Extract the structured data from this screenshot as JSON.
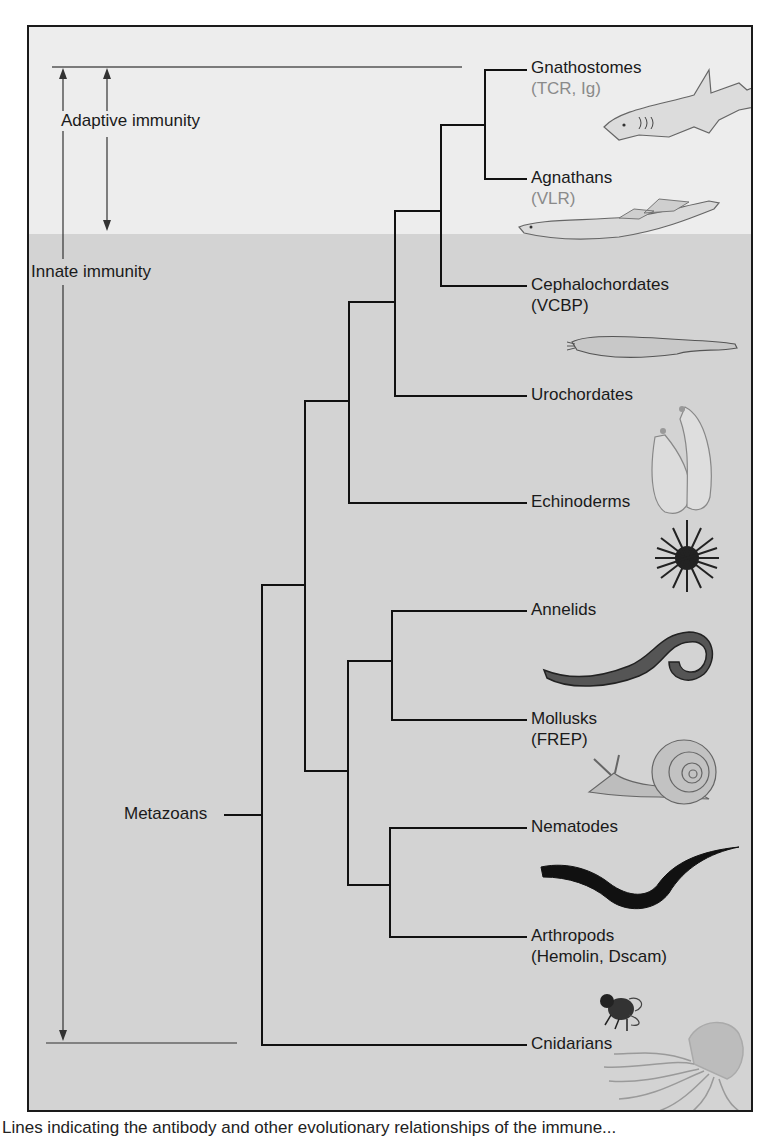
{
  "figure": {
    "colors": {
      "adaptive_bg": "#ededed",
      "innate_bg": "#d3d3d3",
      "line": "#111111",
      "guide_line": "#555555",
      "subtitle_light": "#8a8a8a"
    },
    "ranges": {
      "adaptive": "Adaptive immunity",
      "innate": "Innate immunity"
    },
    "root_label": "Metazoans",
    "taxa": [
      {
        "name": "Gnathostomes",
        "subtitle": "(TCR, Ig)",
        "icon": "shark-icon"
      },
      {
        "name": "Agnathans",
        "subtitle": "(VLR)",
        "icon": "lamprey-icon"
      },
      {
        "name": "Cephalochordates",
        "subtitle": "(VCBP)",
        "icon": "lancelet-icon"
      },
      {
        "name": "Urochordates",
        "subtitle": "",
        "icon": "sea-squirt-icon"
      },
      {
        "name": "Echinoderms",
        "subtitle": "",
        "icon": "sea-urchin-icon"
      },
      {
        "name": "Annelids",
        "subtitle": "",
        "icon": "earthworm-icon"
      },
      {
        "name": "Mollusks",
        "subtitle": "(FREP)",
        "icon": "snail-icon"
      },
      {
        "name": "Nematodes",
        "subtitle": "",
        "icon": "roundworm-icon"
      },
      {
        "name": "Arthropods",
        "subtitle": "(Hemolin, Dscam)",
        "icon": "fly-icon"
      },
      {
        "name": "Cnidarians",
        "subtitle": "",
        "icon": "jellyfish-icon"
      }
    ],
    "caption_partial": "Lines indicating the antibody and other evolutionary relationships of the immune..."
  }
}
